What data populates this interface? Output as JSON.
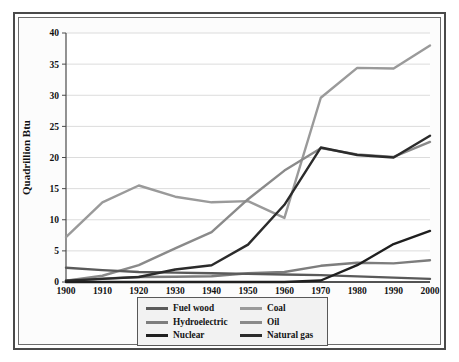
{
  "figure": {
    "frame_color": "#4a4a4a",
    "background": "#ffffff"
  },
  "legend": {
    "position": "bottom-center",
    "background": "#f2f2f2",
    "border_color": "#585858",
    "entries": [
      {
        "label": "Fuel wood",
        "color": "#5a5a5a",
        "column": 0,
        "row": 0
      },
      {
        "label": "Hydroelectric",
        "color": "#7d7d7d",
        "column": 0,
        "row": 1
      },
      {
        "label": "Nuclear",
        "color": "#1f1f1f",
        "column": 0,
        "row": 2
      },
      {
        "label": "Coal",
        "color": "#9a9a9a",
        "column": 1,
        "row": 0
      },
      {
        "label": "Oil",
        "color": "#8a8a8a",
        "column": 1,
        "row": 1
      },
      {
        "label": "Natural gas",
        "color": "#2b2b2b",
        "column": 1,
        "row": 2
      }
    ]
  },
  "chart_data": {
    "type": "line",
    "title": "",
    "subtitle": "",
    "xlabel": "",
    "ylabel": "Quadrillion Btu",
    "x": [
      1900,
      1910,
      1920,
      1930,
      1940,
      1950,
      1960,
      1970,
      1980,
      1990,
      2000
    ],
    "xtick_labels": [
      "1900",
      "1910",
      "1920",
      "1930",
      "1940",
      "1950",
      "1960",
      "1970",
      "1980",
      "1990",
      "2000"
    ],
    "xlim": [
      1900,
      2000
    ],
    "ylim": [
      0,
      40
    ],
    "ytick_values": [
      0,
      5,
      10,
      15,
      20,
      25,
      30,
      35,
      40
    ],
    "ytick_labels": [
      "0",
      "5",
      "10",
      "15",
      "20",
      "25",
      "30",
      "35",
      "40"
    ],
    "grid": "horizontal",
    "grid_color": "#dcdcdc",
    "legend_position": "bottom-center",
    "series": [
      {
        "name": "Coal",
        "color": "#9a9a9a",
        "width": 2.4,
        "values": [
          7.2,
          12.8,
          15.5,
          13.7,
          12.8,
          13.0,
          10.3,
          29.6,
          34.4,
          34.3,
          38.0
        ]
      },
      {
        "name": "Oil",
        "color": "#8a8a8a",
        "width": 2.4,
        "values": [
          0.2,
          1.0,
          2.7,
          5.4,
          8.0,
          13.3,
          17.9,
          21.5,
          20.5,
          20.1,
          22.5
        ]
      },
      {
        "name": "Natural gas",
        "color": "#2b2b2b",
        "width": 2.4,
        "values": [
          0.2,
          0.5,
          0.8,
          2.0,
          2.7,
          6.0,
          12.4,
          21.6,
          20.4,
          20.0,
          23.5
        ]
      },
      {
        "name": "Nuclear",
        "color": "#1f1f1f",
        "width": 2.4,
        "values": [
          0,
          0,
          0,
          0,
          0,
          0,
          0,
          0.24,
          2.7,
          6.1,
          8.2
        ]
      },
      {
        "name": "Hydroelectric",
        "color": "#7d7d7d",
        "width": 2.4,
        "values": [
          0.25,
          0.54,
          0.8,
          0.85,
          0.92,
          1.4,
          1.6,
          2.6,
          3.1,
          3.0,
          3.5
        ]
      },
      {
        "name": "Fuel wood",
        "color": "#5a5a5a",
        "width": 2.4,
        "values": [
          2.3,
          1.9,
          1.6,
          1.5,
          1.4,
          1.3,
          1.2,
          1.1,
          0.9,
          0.7,
          0.5
        ]
      }
    ]
  }
}
